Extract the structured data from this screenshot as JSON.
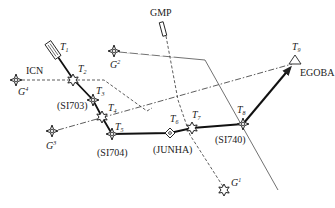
{
  "labels": {
    "icn": "ICN",
    "gmp": "GMP",
    "egoba": "EGOBA",
    "si703": "(SI703)",
    "si704": "(SI704)",
    "junha": "(JUNHA)",
    "si740": "(SI740)"
  },
  "waypoints": {
    "t1": {
      "letter": "T",
      "sub": "1"
    },
    "t2": {
      "letter": "T",
      "sub": "2"
    },
    "t3": {
      "letter": "T",
      "sub": "3"
    },
    "t4": {
      "letter": "T",
      "sub": "4"
    },
    "t5": {
      "letter": "T",
      "sub": "5"
    },
    "t6": {
      "letter": "T",
      "sub": "6"
    },
    "t7": {
      "letter": "T",
      "sub": "7"
    },
    "t8": {
      "letter": "T",
      "sub": "8"
    },
    "t9": {
      "letter": "T",
      "sub": "9"
    }
  },
  "ground_stations": {
    "g1": {
      "letter": "G",
      "sup": "1"
    },
    "g2": {
      "letter": "G",
      "sup": "2"
    },
    "g3": {
      "letter": "G",
      "sup": "3"
    },
    "g4": {
      "letter": "G",
      "sup": "4"
    }
  },
  "colors": {
    "ink": "#222222",
    "background": "#ffffff"
  }
}
